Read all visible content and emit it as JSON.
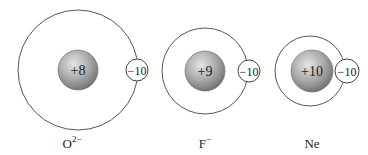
{
  "diagram": {
    "species": [
      {
        "id": "oxide",
        "label": "O",
        "superscript": "2−",
        "nuclear_charge": "+8",
        "electron_charge": "−10",
        "outer_radius": 60,
        "cx": 78,
        "cy": 70,
        "nucleus_cx": 78,
        "electron_cx": 137
      },
      {
        "id": "fluoride",
        "label": "F",
        "superscript": "−",
        "nuclear_charge": "+9",
        "electron_charge": "−10",
        "outer_radius": 43,
        "cx": 205,
        "cy": 71,
        "nucleus_cx": 205,
        "electron_cx": 249
      },
      {
        "id": "neon",
        "label": "Ne",
        "superscript": "",
        "nuclear_charge": "+10",
        "electron_charge": "−10",
        "outer_radius": 35,
        "cx": 310,
        "cy": 71,
        "nucleus_cx": 312,
        "electron_cx": 347
      }
    ],
    "colors": {
      "outline": "#555555",
      "nucleus_light": "#d9d9d9",
      "nucleus_dark": "#7a7a7a",
      "background": "#ffffff"
    }
  }
}
